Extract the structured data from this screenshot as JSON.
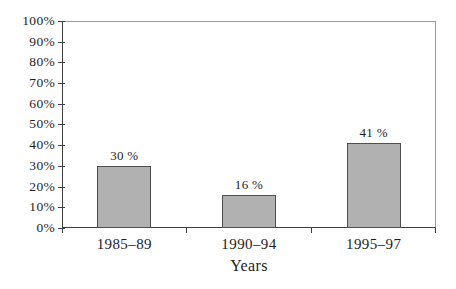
{
  "chart_data": {
    "type": "bar",
    "title": "",
    "categories": [
      "1985–89",
      "1990–94",
      "1995–97"
    ],
    "values": [
      30,
      16,
      41
    ],
    "value_labels": [
      "30 %",
      "16 %",
      "41 %"
    ],
    "xlabel": "Years",
    "ylabel": "",
    "ylim": [
      0,
      100
    ],
    "ytick_step": 10,
    "ytick_labels_top_to_bottom": [
      "100%",
      "90%",
      "80%",
      "70%",
      "60%",
      "50%",
      "40%",
      "30%",
      "20%",
      "10%",
      "0%"
    ],
    "grid": false,
    "legend": false,
    "bar_width_px": 54,
    "colors": {
      "bar_fill": "#b1b1b1",
      "bar_border": "#4f4f4f",
      "axis_dark": "#3f3f3f",
      "frame_light": "#9a9a9a",
      "text": "#1e1e1e",
      "background": "#ffffff"
    }
  }
}
